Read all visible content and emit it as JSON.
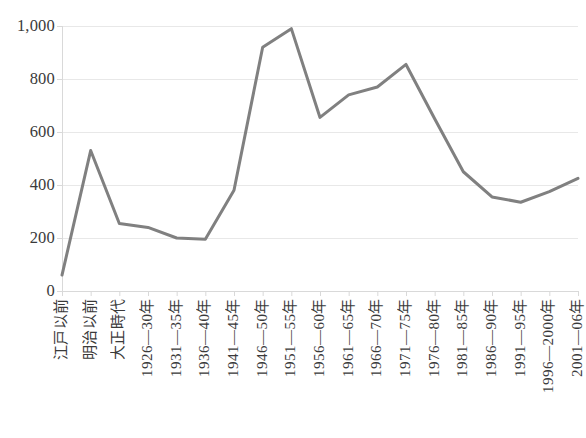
{
  "chart_data": {
    "type": "line",
    "title": "",
    "subtitle": "",
    "xlabel": "",
    "ylabel": "",
    "categories": [
      "江戸以前",
      "明治以前",
      "大正時代",
      "1926—30年",
      "1931—35年",
      "1936—40年",
      "1941—45年",
      "1946—50年",
      "1951—55年",
      "1956—60年",
      "1961—65年",
      "1966—70年",
      "1971—75年",
      "1976—80年",
      "1981—85年",
      "1986—90年",
      "1991—95年",
      "1996—2000年",
      "2001—06年"
    ],
    "values": [
      60,
      530,
      255,
      240,
      200,
      195,
      380,
      920,
      990,
      655,
      740,
      770,
      855,
      650,
      450,
      355,
      335,
      375,
      425
    ],
    "series": [
      {
        "name": "",
        "values": [
          60,
          530,
          255,
          240,
          200,
          195,
          380,
          920,
          990,
          655,
          740,
          770,
          855,
          650,
          450,
          355,
          335,
          375,
          425
        ]
      }
    ],
    "ylim": [
      0,
      1000
    ],
    "yticks": [
      0,
      200,
      400,
      600,
      800,
      1000
    ],
    "ytick_labels": [
      "0",
      "200",
      "400",
      "600",
      "800",
      "1,000"
    ],
    "grid": true,
    "grid_axis": "y",
    "legend": false,
    "legend_position": "none",
    "line_color": "#808080",
    "line_width": 3,
    "grid_color": "#e8e8e8",
    "axis_color": "#d9d9d9",
    "text_color": "#3a3a3a",
    "background": "#ffffff",
    "markers": false
  }
}
